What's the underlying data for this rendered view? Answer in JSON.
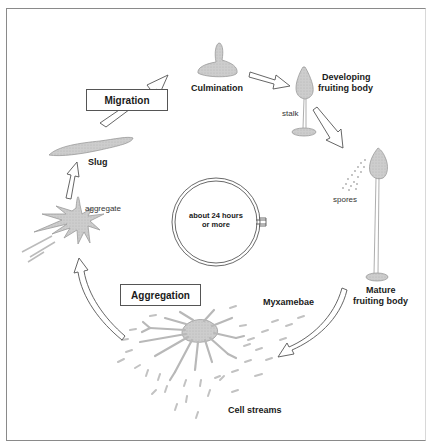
{
  "figure": {
    "colors": {
      "frame": "#8a8a8a",
      "organism_fill": "#c9c9c9",
      "organism_stroke": "#9a9a9a",
      "arrow_stroke": "#555555",
      "text": "#1a1a1a"
    }
  },
  "stages": {
    "migration": "Migration",
    "aggregation": "Aggregation"
  },
  "labels": {
    "culmination": "Culmination",
    "developing_line1": "Developing",
    "developing_line2": "fruiting body",
    "stalk": "stalk",
    "spores": "spores",
    "mature_line1": "Mature",
    "mature_line2": "fruiting body",
    "myxamebae": "Myxamebae",
    "cell_streams": "Cell streams",
    "aggregate": "aggregate",
    "slug": "Slug"
  },
  "clock": {
    "line1": "about 24 hours",
    "line2": "or more"
  },
  "icons": {
    "cycle_arrows": "hollow-arrow-icon",
    "timer": "stopwatch-icon"
  }
}
